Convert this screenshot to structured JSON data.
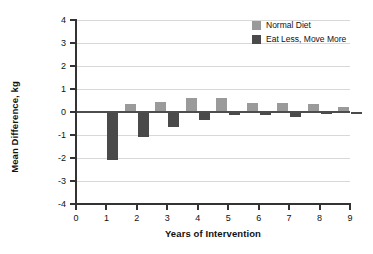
{
  "chart_data": {
    "type": "bar",
    "title": "",
    "xlabel": "Years of Intervention",
    "ylabel": "Mean Difference, kg",
    "categories": [
      "1",
      "2",
      "3",
      "4",
      "5",
      "6",
      "7",
      "8",
      "9"
    ],
    "x": [
      1,
      2,
      3,
      4,
      5,
      6,
      7,
      8,
      9
    ],
    "xlim": [
      0,
      9
    ],
    "ylim": [
      -4,
      4
    ],
    "xticks": [
      "0",
      "1",
      "2",
      "3",
      "4",
      "5",
      "6",
      "7",
      "8",
      "9"
    ],
    "yticks": [
      "4",
      "3",
      "2",
      "1",
      "0",
      "-1",
      "-2",
      "-3",
      "-4"
    ],
    "grid": true,
    "legend_position": "top-right",
    "series": [
      {
        "name": "Normal Diet",
        "color": "#9a9a9a",
        "values": [
          0,
          0.35,
          0.45,
          0.6,
          0.6,
          0.4,
          0.4,
          0.35,
          0.2
        ]
      },
      {
        "name": "Eat Less, Move More",
        "color": "#4a4a4a",
        "values": [
          -2.1,
          -1.1,
          -0.65,
          -0.35,
          -0.15,
          -0.15,
          -0.2,
          -0.1,
          -0.1
        ]
      }
    ]
  },
  "legend": {
    "items": [
      {
        "label": "Normal Diet",
        "color": "#9a9a9a",
        "swatch": "legend-swatch-normal-diet"
      },
      {
        "label": "Eat Less, Move More",
        "color": "#4a4a4a",
        "swatch": "legend-swatch-eat-less-move-more"
      }
    ]
  },
  "axes": {
    "y_title": "Mean Difference, kg",
    "x_title": "Years of Intervention"
  }
}
